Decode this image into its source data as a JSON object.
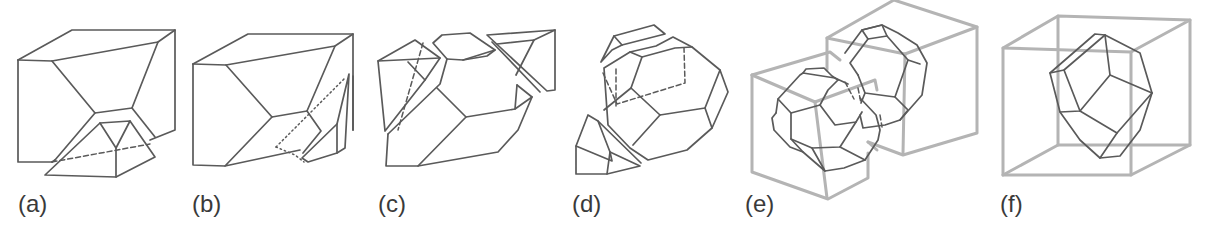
{
  "figure": {
    "colors": {
      "solid_line": "#5a5a5a",
      "cube_line": "#b4b4b4",
      "background": "#ffffff"
    },
    "panels": [
      {
        "id": "a",
        "label": "(a)",
        "label_x": 18,
        "solid": [
          "M18,60 L72,30 L175,30 L175,130 L150,140",
          "M18,60 L52,61 L158,42 L175,30",
          "M18,60 L18,162 L52,162",
          "M52,61 L95,113 L132,108 L158,42",
          "M95,113 L55,160",
          "M132,108 L155,137",
          "M55,160 L52,162",
          "M45,175 L100,123 L130,121 L155,157 L116,177 Z",
          "M100,123 L116,148 L130,121",
          "M116,148 L116,177"
        ],
        "dashed": [
          "M52,162 L150,144"
        ],
        "dotted": [],
        "cube": []
      },
      {
        "id": "b",
        "label": "(b)",
        "label_x": 192,
        "solid": [
          "M193,64 L248,34 L353,34 L353,130",
          "M193,64 L226,65 L335,46 L353,34",
          "M193,64 L193,165 L225,166",
          "M226,65 L272,117 L307,111 L335,46",
          "M272,117 L225,166 L300,150",
          "M307,111 L321,131 L303,153",
          "M302,158 L337,124 L349,74 L345,148 L337,153 L308,162 Z",
          "M337,124 L337,153",
          "M353,76 L353,130"
        ],
        "dashed": [],
        "dotted": [
          "M276,147 L295,155 L304,162",
          "M276,147 L345,78"
        ],
        "cube": []
      },
      {
        "id": "c",
        "label": "(c)",
        "label_x": 378,
        "solid": [
          "M378,61 L415,40 L440,58 L425,80 L385,131 Z",
          "M378,61 L440,58",
          "M408,62 L425,80",
          "M388,134 L440,84 L447,59 L433,43 L442,35 L470,33 L495,50 L487,56 L463,60",
          "M447,59 L463,60 L495,50",
          "M388,134 L386,166 L418,166 L498,152 L518,130 L532,97 L517,85",
          "M418,166 L466,117 L437,88",
          "M466,117 L515,109 L532,97",
          "M515,109 L517,85",
          "M487,35 L555,30 L555,90 L547,91 Z",
          "M497,44 L534,40 L516,75",
          "M534,40 L555,30",
          "M492,42 L540,92"
        ],
        "dashed": [
          "M423,43 L398,130"
        ],
        "dotted": [],
        "cube": []
      },
      {
        "id": "d",
        "label": "(d)",
        "label_x": 572,
        "solid": [
          "M601,62 L614,36 L654,25 L665,34 L622,45 L612,50 Z",
          "M614,36 L622,45",
          "M604,68 L630,52 L656,46 L673,37 L692,47 L720,70 L728,92 L712,128 L687,150 L648,160 L630,148 L608,125 Z",
          "M630,52 L642,57 L675,48 L692,47",
          "M642,57 L631,88 L660,115 L705,108 L720,70",
          "M631,88 L604,110",
          "M660,115 L633,145",
          "M705,108 L712,128",
          "M576,146 L588,115 L598,121 L610,152 L612,161 Z",
          "M576,146 L576,174 L607,174 L640,166 L610,152",
          "M607,174 L610,152",
          "M598,121 L641,163"
        ],
        "dashed": [
          "M603,73 L617,104 L685,83 L684,48",
          "M616,106 L616,68"
        ],
        "dotted": [],
        "cube": []
      },
      {
        "id": "e",
        "label": "(e)",
        "label_x": 745,
        "solid": [
          "M803,73 L806,69 L824,68 L832,76 L838,80",
          "M776,113 L778,99 L800,75 L803,73 L835,78 L848,84",
          "M776,113 L772,118 L774,130 L790,147 L803,152 L825,171 L844,168 L865,160 L878,140 L880,130 L876,115 L860,98",
          "M778,99 L791,113 L791,139 L803,152",
          "M791,113 L820,105 L828,90 L838,80",
          "M820,105 L835,125 L856,122 L862,112",
          "M791,139 L812,148 L840,147 L856,122",
          "M812,148 L825,171",
          "M840,147 L865,160",
          "M845,53 L862,30 L882,25 L898,33 L917,45 L927,63 L922,95 L900,120 L885,125 L863,128 L860,115",
          "M862,30 L882,25 L887,36 L868,39 Z",
          "M868,39 L850,63 L858,75",
          "M887,36 L908,60 L920,64",
          "M858,75 L865,93 L895,97 L908,60",
          "M895,97 L908,110 L900,120",
          "M865,93 L861,103"
        ],
        "dashed": [
          "M845,82 L854,99",
          "M858,88 L861,103",
          "M880,115 L882,127"
        ],
        "dotted": [],
        "cube": [
          "M752,75 L830,52 L840,60",
          "M752,75 L752,172 L828,199 L868,178 L868,153",
          "M752,75 L815,102 L875,80 L877,90",
          "M815,102 L827,198",
          "M827,38 L894,0 L977,27 L905,54 L827,38",
          "M827,38 L827,70",
          "M977,27 L977,133 L903,155 L868,142",
          "M905,54 L903,153",
          "M868,142 L877,150"
        ],
        "cube_width": 3
      },
      {
        "id": "f",
        "label": "(f)",
        "label_x": 1000,
        "solid": [
          "M1050,73 L1095,34 L1105,35 L1140,53 L1152,93 L1140,130 L1120,156 L1100,158 L1080,140 L1060,112 L1050,73 Z",
          "M1050,73 L1064,70 L1105,35",
          "M1064,70 L1080,111 L1060,112",
          "M1080,111 L1110,75 L1105,35",
          "M1110,75 L1152,93",
          "M1080,111 L1117,133 L1100,158",
          "M1117,133 L1152,93"
        ],
        "dashed": [],
        "dotted": [],
        "cube": [
          "M1003,48 L1058,16 L1190,20 L1131,52 Z",
          "M1003,48 L1003,175 L1131,175 L1190,145 L1190,20",
          "M1131,52 L1131,175",
          "M1058,16 L1058,145 L1190,145",
          "M1058,145 L1003,175"
        ],
        "cube_width": 3
      }
    ]
  }
}
